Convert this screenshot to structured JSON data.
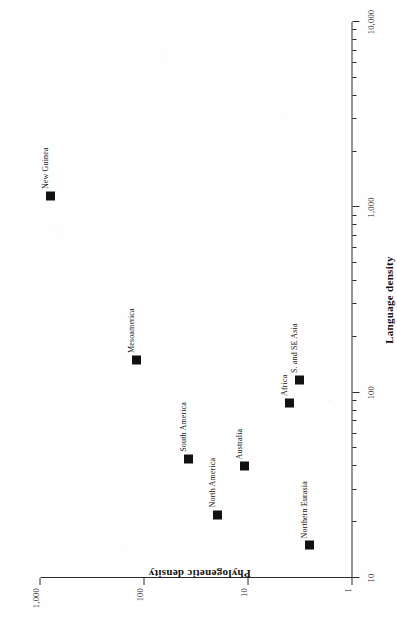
{
  "chart_data": {
    "type": "scatter",
    "title": "",
    "xlabel": "Language density",
    "ylabel": "Phylogenetic density",
    "xscale": "log",
    "yscale": "log",
    "xlim": [
      10,
      10000
    ],
    "ylim": [
      1,
      1000
    ],
    "grid": false,
    "legend": "none",
    "orientation": "page rotated 90 degrees counter-clockwise",
    "x_ticklabels": [
      "10",
      "100",
      "1,000",
      "10,000"
    ],
    "x_tickvalues": [
      10,
      100,
      1000,
      10000
    ],
    "y_ticklabels": [
      "1",
      "10",
      "100",
      "1,000"
    ],
    "y_tickvalues": [
      1,
      10,
      100,
      1000
    ],
    "marker": "filled-square",
    "marker_color": "#111111",
    "points": [
      {
        "label": "New Guinea",
        "x": 1150,
        "y": 800
      },
      {
        "label": "Mesoamerica",
        "x": 150,
        "y": 120
      },
      {
        "label": "South America",
        "x": 44,
        "y": 38
      },
      {
        "label": "Australia",
        "x": 40,
        "y": 11
      },
      {
        "label": "North America",
        "x": 22,
        "y": 20
      },
      {
        "label": "Northern Eurasia",
        "x": 15,
        "y": 2.6
      },
      {
        "label": "Africa",
        "x": 88,
        "y": 4.0
      },
      {
        "label": "S. and SE Asia",
        "x": 117,
        "y": 3.2
      }
    ]
  },
  "figure": {
    "x_axis_title": "Language density",
    "y_axis_title": "Phylogenetic density"
  }
}
